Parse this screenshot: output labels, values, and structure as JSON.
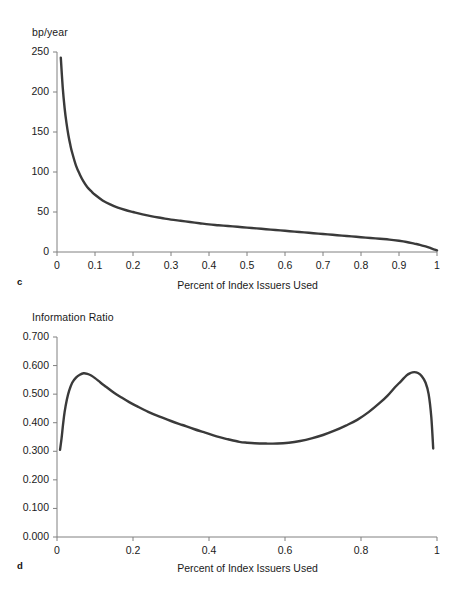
{
  "figure": {
    "background": "#ffffff",
    "curve_color": "#3a3a3a",
    "axis_color": "#808080"
  },
  "panel_c": {
    "letter": "c",
    "y_axis_title": "bp/year",
    "x_axis_title": "Percent of Index Issuers Used",
    "y_ticks": [
      "0",
      "50",
      "100",
      "150",
      "200",
      "250"
    ],
    "x_ticks": [
      "0",
      "0.1",
      "0.2",
      "0.3",
      "0.4",
      "0.5",
      "0.6",
      "0.7",
      "0.8",
      "0.9",
      "1"
    ]
  },
  "panel_d": {
    "letter": "d",
    "y_axis_title": "Information Ratio",
    "x_axis_title": "Percent of Index Issuers Used",
    "y_ticks": [
      "0.000",
      "0.100",
      "0.200",
      "0.300",
      "0.400",
      "0.500",
      "0.600",
      "0.700"
    ],
    "x_ticks": [
      "0",
      "0.2",
      "0.4",
      "0.6",
      "0.8",
      "1"
    ]
  },
  "chart_data": [
    {
      "type": "line",
      "panel": "c",
      "title": "",
      "xlabel": "Percent of Index Issuers Used",
      "ylabel": "bp/year",
      "xlim": [
        0,
        1
      ],
      "ylim": [
        0,
        250
      ],
      "xticks": [
        0,
        0.1,
        0.2,
        0.3,
        0.4,
        0.5,
        0.6,
        0.7,
        0.8,
        0.9,
        1
      ],
      "yticks": [
        0,
        50,
        100,
        150,
        200,
        250
      ],
      "grid": false,
      "legend": "none",
      "series": [
        {
          "name": "Tracking error (bp/year)",
          "x": [
            0.01,
            0.015,
            0.02,
            0.025,
            0.03,
            0.035,
            0.04,
            0.05,
            0.06,
            0.07,
            0.08,
            0.09,
            0.1,
            0.12,
            0.14,
            0.16,
            0.18,
            0.2,
            0.225,
            0.25,
            0.275,
            0.3,
            0.325,
            0.35,
            0.375,
            0.4,
            0.425,
            0.45,
            0.475,
            0.5,
            0.525,
            0.55,
            0.575,
            0.6,
            0.625,
            0.65,
            0.675,
            0.7,
            0.725,
            0.75,
            0.775,
            0.8,
            0.825,
            0.85,
            0.875,
            0.9,
            0.92,
            0.94,
            0.955,
            0.97,
            0.98,
            0.988,
            0.994,
            1.0
          ],
          "y": [
            243,
            206,
            180,
            161,
            146,
            134,
            124,
            108,
            97,
            88,
            81,
            76,
            71.5,
            64.5,
            59.5,
            55.5,
            52.5,
            50,
            47,
            44.5,
            42.5,
            40.5,
            39,
            37.5,
            36,
            34.5,
            33.5,
            32.5,
            31.5,
            30.5,
            29.5,
            28.5,
            27.5,
            26.5,
            25.5,
            24.5,
            23.5,
            22.5,
            21.5,
            20.5,
            19.5,
            18.5,
            17.5,
            16.5,
            15.5,
            14.0,
            12.5,
            10.5,
            9.0,
            7.0,
            5.5,
            4.0,
            3.0,
            2.0
          ]
        }
      ]
    },
    {
      "type": "line",
      "panel": "d",
      "title": "",
      "xlabel": "Percent of Index Issuers Used",
      "ylabel": "Information Ratio",
      "xlim": [
        0,
        1
      ],
      "ylim": [
        0,
        0.7
      ],
      "xticks": [
        0,
        0.2,
        0.4,
        0.6,
        0.8,
        1
      ],
      "yticks": [
        0.0,
        0.1,
        0.2,
        0.3,
        0.4,
        0.5,
        0.6,
        0.7
      ],
      "grid": false,
      "legend": "none",
      "series": [
        {
          "name": "Information Ratio",
          "x": [
            0.008,
            0.012,
            0.016,
            0.02,
            0.026,
            0.032,
            0.04,
            0.05,
            0.06,
            0.07,
            0.08,
            0.09,
            0.1,
            0.115,
            0.13,
            0.15,
            0.17,
            0.19,
            0.21,
            0.24,
            0.27,
            0.3,
            0.33,
            0.36,
            0.39,
            0.42,
            0.45,
            0.48,
            0.5,
            0.52,
            0.55,
            0.58,
            0.61,
            0.64,
            0.67,
            0.7,
            0.73,
            0.76,
            0.79,
            0.82,
            0.85,
            0.87,
            0.89,
            0.905,
            0.92,
            0.93,
            0.94,
            0.95,
            0.96,
            0.97,
            0.978,
            0.985,
            0.99
          ],
          "y": [
            0.305,
            0.345,
            0.395,
            0.437,
            0.481,
            0.512,
            0.54,
            0.558,
            0.568,
            0.573,
            0.571,
            0.565,
            0.556,
            0.54,
            0.525,
            0.505,
            0.488,
            0.472,
            0.458,
            0.438,
            0.421,
            0.406,
            0.392,
            0.378,
            0.365,
            0.352,
            0.342,
            0.333,
            0.33,
            0.328,
            0.327,
            0.327,
            0.33,
            0.336,
            0.345,
            0.357,
            0.372,
            0.39,
            0.41,
            0.437,
            0.47,
            0.495,
            0.525,
            0.545,
            0.566,
            0.574,
            0.577,
            0.574,
            0.563,
            0.54,
            0.5,
            0.42,
            0.31
          ]
        }
      ]
    }
  ]
}
